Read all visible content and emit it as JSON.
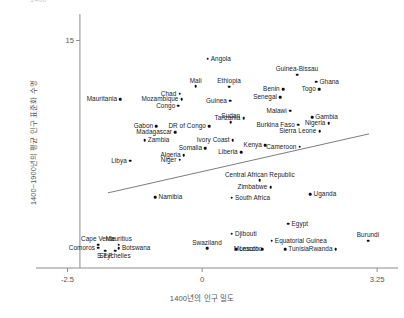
{
  "chart_data": {
    "type": "scatter",
    "title": "",
    "xlabel": "1400년의 인구 밀도",
    "ylabel": "1400~1900년의 평균 인구 표준화 수명",
    "xlim": [
      -2.9,
      3.6
    ],
    "ylim": [
      -1.2,
      16.6
    ],
    "xticks": [
      "-2.5",
      "0",
      "3.25"
    ],
    "xtick_values": [
      -2.5,
      0,
      3.25
    ],
    "yticks": [
      "15"
    ],
    "ytick_values": [
      15
    ],
    "grid": false,
    "legend": null,
    "fit_line": {
      "label": "linear fit",
      "x_start": -1.75,
      "y_start": 4.15,
      "x_end": 3.1,
      "y_end": 8.35
    },
    "top_cropped_text": "1400",
    "points": [
      {
        "label": "Angola",
        "x": 0.1,
        "y": 13.7,
        "label_side": "right"
      },
      {
        "label": "Guinea-Bissau",
        "x": 1.76,
        "y": 12.55,
        "label_side": "above"
      },
      {
        "label": "Ghana",
        "x": 2.12,
        "y": 12.05,
        "label_side": "right"
      },
      {
        "label": "Mali",
        "x": -0.12,
        "y": 11.75,
        "label_side": "above"
      },
      {
        "label": "Ethiopia",
        "x": 0.5,
        "y": 11.7,
        "label_side": "above"
      },
      {
        "label": "Benin",
        "x": 1.5,
        "y": 11.55,
        "label_side": "left"
      },
      {
        "label": "Togo",
        "x": 2.17,
        "y": 11.55,
        "label_side": "left"
      },
      {
        "label": "Chad",
        "x": -0.42,
        "y": 11.2,
        "label_side": "left"
      },
      {
        "label": "Senegal",
        "x": 1.45,
        "y": 10.95,
        "label_side": "left"
      },
      {
        "label": "Mozambique",
        "x": -0.38,
        "y": 10.8,
        "label_side": "left"
      },
      {
        "label": "Guinea",
        "x": 0.52,
        "y": 10.7,
        "label_side": "left"
      },
      {
        "label": "Congo",
        "x": -0.44,
        "y": 10.35,
        "label_side": "left"
      },
      {
        "label": "Mauritania",
        "x": -1.52,
        "y": 10.8,
        "label_side": "left"
      },
      {
        "label": "Malawi",
        "x": 1.63,
        "y": 10.0,
        "label_side": "left"
      },
      {
        "label": "Gambia",
        "x": 2.04,
        "y": 9.55,
        "label_side": "right"
      },
      {
        "label": "Nigeria",
        "x": 2.35,
        "y": 9.1,
        "label_side": "left"
      },
      {
        "label": "Tanzania",
        "x": 0.77,
        "y": 9.45,
        "label_side": "left"
      },
      {
        "label": "Sudan",
        "x": 0.53,
        "y": 9.2,
        "label_side": "above"
      },
      {
        "label": "Burkina Faso",
        "x": 1.78,
        "y": 9.0,
        "label_side": "left"
      },
      {
        "label": "Sierra Leone",
        "x": 2.18,
        "y": 8.55,
        "label_side": "left"
      },
      {
        "label": "Gabon",
        "x": -0.85,
        "y": 8.9,
        "label_side": "left"
      },
      {
        "label": "DR of Congo",
        "x": 0.13,
        "y": 8.9,
        "label_side": "left"
      },
      {
        "label": "Madagascar",
        "x": -0.5,
        "y": 8.45,
        "label_side": "left"
      },
      {
        "label": "Ivory Coast",
        "x": 0.57,
        "y": 7.9,
        "label_side": "left"
      },
      {
        "label": "Zambia",
        "x": -1.07,
        "y": 7.9,
        "label_side": "right"
      },
      {
        "label": "Kenya",
        "x": 1.17,
        "y": 7.55,
        "label_side": "left"
      },
      {
        "label": "Cameroon",
        "x": 1.81,
        "y": 7.45,
        "label_side": "left"
      },
      {
        "label": "Somalia",
        "x": 0.06,
        "y": 7.35,
        "label_side": "left"
      },
      {
        "label": "Liberia",
        "x": 0.72,
        "y": 7.05,
        "label_side": "left"
      },
      {
        "label": "Algeria",
        "x": -0.34,
        "y": 6.85,
        "label_side": "left"
      },
      {
        "label": "Niger",
        "x": -0.42,
        "y": 6.5,
        "label_side": "left"
      },
      {
        "label": "Libya",
        "x": -1.34,
        "y": 6.45,
        "label_side": "left"
      },
      {
        "label": "Central African Republic",
        "x": 1.07,
        "y": 5.05,
        "label_side": "above"
      },
      {
        "label": "Zimbabwe",
        "x": 1.27,
        "y": 4.55,
        "label_side": "left"
      },
      {
        "label": "Namibia",
        "x": -0.87,
        "y": 3.85,
        "label_side": "right"
      },
      {
        "label": "South Africa",
        "x": 0.55,
        "y": 3.8,
        "label_side": "right"
      },
      {
        "label": "Uganda",
        "x": 2.01,
        "y": 4.05,
        "label_side": "right"
      },
      {
        "label": "Egypt",
        "x": 1.6,
        "y": 1.95,
        "label_side": "right"
      },
      {
        "label": "Djibouti",
        "x": 0.55,
        "y": 1.25,
        "label_side": "right"
      },
      {
        "label": "Equatorial Guinea",
        "x": 1.29,
        "y": 0.75,
        "label_side": "right"
      },
      {
        "label": "Burundi",
        "x": 3.08,
        "y": 0.75,
        "label_side": "above"
      },
      {
        "label": "Swaziland",
        "x": 0.09,
        "y": 0.2,
        "label_side": "above"
      },
      {
        "label": "Lesotho",
        "x": 0.63,
        "y": 0.15,
        "label_side": "right"
      },
      {
        "label": "Morocco",
        "x": 1.11,
        "y": 0.15,
        "label_side": "left"
      },
      {
        "label": "Tunisia",
        "x": 1.54,
        "y": 0.15,
        "label_side": "right"
      },
      {
        "label": "Rwanda",
        "x": 2.48,
        "y": 0.15,
        "label_side": "left"
      },
      {
        "label": "Cape Verde",
        "x": -1.93,
        "y": 0.45,
        "label_side": "above"
      },
      {
        "label": "Mauritius",
        "x": -1.55,
        "y": 0.45,
        "label_side": "above"
      },
      {
        "label": "Comoros",
        "x": -1.93,
        "y": 0.25,
        "label_side": "left"
      },
      {
        "label": "Botswana",
        "x": -1.55,
        "y": 0.22,
        "label_side": "right"
      },
      {
        "label": "S.T.P.",
        "x": -1.8,
        "y": 0.02,
        "label_side": "below"
      },
      {
        "label": "Seychelles",
        "x": -1.62,
        "y": 0.02,
        "label_side": "below"
      }
    ]
  },
  "axes": {
    "y_tick_15": "15",
    "x_tick_min": "-2.5",
    "x_tick_mid": "0",
    "x_tick_max": "3.25",
    "x_axis_title": "1400년의 인구 밀도",
    "y_axis_title": "1400~1900년의 평균 인구 표준화 수명",
    "top_clipped": "1400"
  },
  "colors": {
    "point": "#111111",
    "axis": "#8c8c8c",
    "fit_line": "#6e6e6e",
    "text": "#1a1a1a",
    "axis_text": "#555555"
  }
}
